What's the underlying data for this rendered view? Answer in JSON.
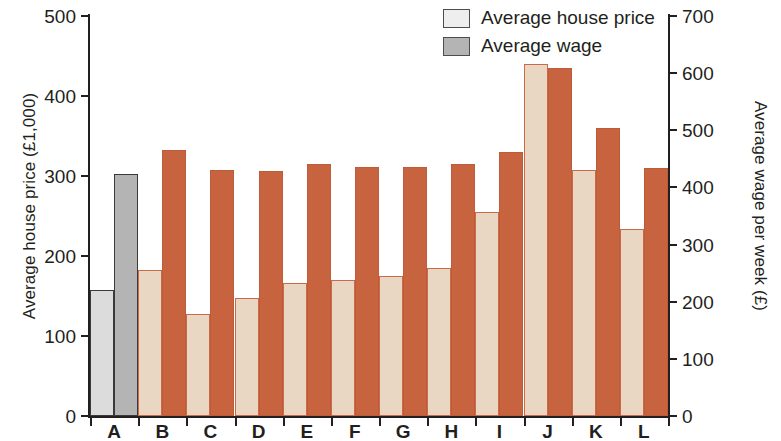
{
  "chart_data": {
    "type": "bar",
    "title": "",
    "categories": [
      "A",
      "B",
      "C",
      "D",
      "E",
      "F",
      "G",
      "H",
      "I",
      "J",
      "K",
      "L"
    ],
    "series": [
      {
        "name": "Average house price",
        "axis": "left",
        "unit": "£1,000",
        "values": [
          158,
          182,
          128,
          148,
          166,
          170,
          175,
          185,
          255,
          440,
          307,
          234
        ]
      },
      {
        "name": "Average wage",
        "axis": "right",
        "unit": "£ per week",
        "values": [
          423,
          466,
          430,
          429,
          441,
          436,
          436,
          441,
          462,
          609,
          504,
          434
        ]
      }
    ],
    "xlabel": "",
    "ylabel_left": "Average house price (£1,000)",
    "ylabel_right": "Average wage per week (£)",
    "ylim_left": [
      0,
      500
    ],
    "ylim_right": [
      0,
      700
    ],
    "yticks_left": [
      "0",
      "100",
      "200",
      "300",
      "400",
      "500"
    ],
    "yticks_right": [
      "0",
      "100",
      "200",
      "300",
      "400",
      "500",
      "600",
      "700"
    ],
    "grid": false,
    "legend_position": "top-right"
  },
  "axes": {
    "left": {
      "title": "Average house price (£1,000)",
      "ticks": [
        {
          "label": "500",
          "value": 500
        },
        {
          "label": "400",
          "value": 400
        },
        {
          "label": "300",
          "value": 300
        },
        {
          "label": "200",
          "value": 200
        },
        {
          "label": "100",
          "value": 100
        },
        {
          "label": "0",
          "value": 0
        }
      ]
    },
    "right": {
      "title": "Average wage per week (£)",
      "ticks": [
        {
          "label": "700",
          "value": 700
        },
        {
          "label": "600",
          "value": 600
        },
        {
          "label": "500",
          "value": 500
        },
        {
          "label": "400",
          "value": 400
        },
        {
          "label": "300",
          "value": 300
        },
        {
          "label": "200",
          "value": 200
        },
        {
          "label": "100",
          "value": 100
        },
        {
          "label": "0",
          "value": 0
        }
      ]
    },
    "bottom": {
      "labels": [
        "A",
        "B",
        "C",
        "D",
        "E",
        "F",
        "G",
        "H",
        "I",
        "J",
        "K",
        "L"
      ]
    }
  },
  "legend": {
    "items": [
      {
        "label": "Average house price",
        "swatch": "house"
      },
      {
        "label": "Average wage",
        "swatch": "wage"
      }
    ]
  },
  "colors": {
    "house_price": "#e9d6c3",
    "average_wage": "#c8633f",
    "house_price_mono": "#dcdcdc",
    "average_wage_mono": "#b4b4b4",
    "axis": "#231f20"
  }
}
